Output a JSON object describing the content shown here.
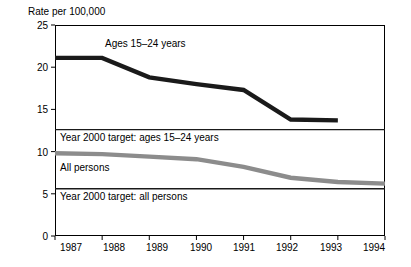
{
  "chart_data": {
    "type": "line",
    "title": "",
    "ylabel": "Rate per 100,000",
    "xlabel": "",
    "ylim": [
      0,
      25
    ],
    "yticks": [
      0,
      5,
      10,
      15,
      20,
      25
    ],
    "grid": false,
    "legend_position": "inline-annotations",
    "x": [
      1987,
      1988,
      1989,
      1990,
      1991,
      1992,
      1993,
      1994
    ],
    "series": [
      {
        "name": "Ages 15–24 years",
        "color": "#1a1a1a",
        "values": [
          21.1,
          21.1,
          18.8,
          18.0,
          17.3,
          13.8,
          13.7,
          null
        ]
      },
      {
        "name": "All persons",
        "color": "#8c8c8c",
        "values": [
          9.8,
          9.7,
          9.4,
          9.1,
          8.2,
          6.9,
          6.4,
          6.2
        ]
      }
    ],
    "reference_lines": [
      {
        "name": "Year 2000 target: ages 15–24 years",
        "value": 12.6,
        "color": "#1a1a1a",
        "x_start": 1987,
        "x_end": 1994
      },
      {
        "name": "Year 2000 target: all persons",
        "value": 5.6,
        "color": "#1a1a1a",
        "x_start": 1987,
        "x_end": 1994
      }
    ],
    "annotations": [
      {
        "text": "Ages 15–24 years",
        "x": 1988.0,
        "y": 22.7
      },
      {
        "text": "Year 2000 target: ages 15–24 years",
        "x": 1987.05,
        "y": 11.6
      },
      {
        "text": "All persons",
        "x": 1987.05,
        "y": 8.1
      },
      {
        "text": "Year 2000 target: all persons",
        "x": 1987.05,
        "y": 4.6
      }
    ],
    "ytick_labels": [
      "0",
      "5",
      "10",
      "15",
      "20",
      "25"
    ],
    "xtick_labels": [
      "1987",
      "1988",
      "1989",
      "1990",
      "1991",
      "1992",
      "1993",
      "1994"
    ]
  },
  "axis": {
    "y_title": "Rate per 100,000"
  },
  "annotations": {
    "ages_series": "Ages 15–24 years",
    "target_ages": "Year 2000 target: ages 15–24 years",
    "all_persons_series": "All persons",
    "target_all": "Year 2000 target: all persons"
  },
  "ytick_labels": {
    "t0": "0",
    "t1": "5",
    "t2": "10",
    "t3": "15",
    "t4": "20",
    "t5": "25"
  },
  "xtick_labels": {
    "x0": "1987",
    "x1": "1988",
    "x2": "1989",
    "x3": "1990",
    "x4": "1991",
    "x5": "1992",
    "x6": "1993",
    "x7": "1994"
  }
}
